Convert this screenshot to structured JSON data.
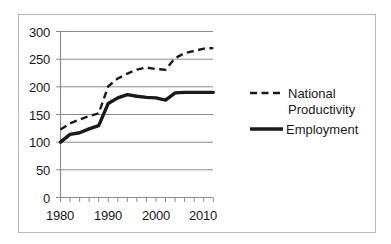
{
  "chart_data": {
    "type": "line",
    "title": "",
    "subtitle": "",
    "xlabel": "",
    "ylabel": "",
    "xlim": [
      1979,
      2013
    ],
    "ylim": [
      0,
      300
    ],
    "grid": true,
    "grid_axis": "y",
    "legend_position": "right",
    "y_ticks": [
      0,
      50,
      100,
      150,
      200,
      250,
      300
    ],
    "y_tick_labels": [
      "0",
      "50",
      "100",
      "150",
      "200",
      "250",
      "300"
    ],
    "x_ticks": [
      1980,
      1982,
      1984,
      1986,
      1988,
      1990,
      1992,
      1994,
      1996,
      1998,
      2000,
      2002,
      2004,
      2006,
      2008,
      2010,
      2012
    ],
    "x_tick_labels": [
      "1980",
      "",
      "",
      "",
      "",
      "1990",
      "",
      "",
      "",
      "",
      "2000",
      "",
      "",
      "",
      "",
      "2010",
      ""
    ],
    "x_labeled_ticks": [
      "1980",
      "1990",
      "2000",
      "2010"
    ],
    "x": [
      1980,
      1982,
      1984,
      1986,
      1988,
      1990,
      1992,
      1994,
      1996,
      1998,
      2000,
      2002,
      2004,
      2006,
      2008,
      2010,
      2012
    ],
    "series": [
      {
        "name": "National Productivity",
        "style": "dashed",
        "color": "#1a1a1a",
        "values": [
          123,
          134,
          141,
          147,
          152,
          201,
          215,
          224,
          231,
          235,
          232,
          231,
          252,
          261,
          265,
          269,
          270
        ]
      },
      {
        "name": "Employment",
        "style": "solid",
        "color": "#1a1a1a",
        "values": [
          100,
          114,
          117,
          124,
          130,
          170,
          180,
          186,
          183,
          181,
          180,
          176,
          189,
          190,
          190,
          190,
          190
        ]
      }
    ],
    "legend": [
      {
        "label_line1": "National",
        "label_line2": "Productivity",
        "style": "dashed"
      },
      {
        "label_line1": "Employment",
        "label_line2": "",
        "style": "solid"
      }
    ]
  },
  "colors": {
    "line": "#1a1a1a",
    "grid": "#8c8c8c",
    "axis": "#8c8c8c",
    "frame": "#b9b9b9",
    "text": "#1a1a1a",
    "background": "#ffffff"
  }
}
